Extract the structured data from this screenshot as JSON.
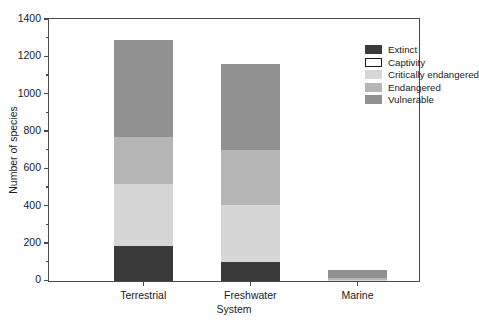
{
  "chart_data": {
    "type": "bar",
    "subtype": "stacked-bar",
    "title": "",
    "xlabel": "System",
    "ylabel": "Number of species",
    "categories": [
      "Terrestrial",
      "Freshwater",
      "Marine"
    ],
    "ylim": [
      0,
      1400
    ],
    "yticks": [
      0,
      200,
      400,
      600,
      800,
      1000,
      1200,
      1400
    ],
    "ytick_labels": [
      "0",
      "200",
      "400",
      "600",
      "800",
      "1000",
      "1200",
      "1400"
    ],
    "yminor_ticks": [
      100,
      300,
      500,
      700,
      900,
      1100,
      1300
    ],
    "grid": false,
    "legend_position": "top-right-inside",
    "series": [
      {
        "name": "Extinct",
        "color": "#3a3a3a",
        "border": "none",
        "values": [
          190,
          100,
          0
        ]
      },
      {
        "name": "Captivity",
        "color": "#ffffff",
        "border": "#1a1a1a",
        "values": [
          0,
          0,
          0
        ]
      },
      {
        "name": "Critically endangered",
        "color": "#d6d6d6",
        "border": "none",
        "values": [
          330,
          305,
          6
        ]
      },
      {
        "name": "Endangered",
        "color": "#b5b5b5",
        "border": "none",
        "values": [
          250,
          295,
          10
        ]
      },
      {
        "name": "Vulnerable",
        "color": "#909090",
        "border": "none",
        "values": [
          520,
          460,
          42
        ]
      }
    ],
    "totals": [
      1290,
      1160,
      58
    ]
  },
  "legend": {
    "items": [
      {
        "label": "Extinct"
      },
      {
        "label": "Captivity"
      },
      {
        "label": "Critically endangered"
      },
      {
        "label": "Endangered"
      },
      {
        "label": "Vulnerable"
      }
    ]
  },
  "axes": {
    "y_title": "Number of species",
    "x_title": "System",
    "y_labels": [
      "1400",
      "1200",
      "1000",
      "800",
      "600",
      "400",
      "200",
      "0"
    ],
    "x_labels": [
      "Terrestrial",
      "Freshwater",
      "Marine"
    ]
  }
}
